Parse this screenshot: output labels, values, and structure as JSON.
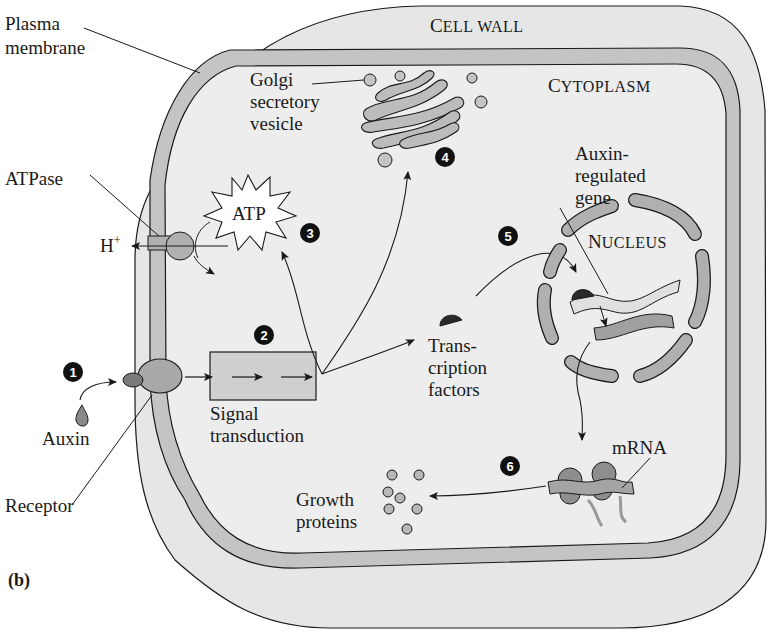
{
  "figure": {
    "panel_label": "(b)",
    "colors": {
      "cell_wall": "#e6e6e6",
      "cytoplasm": "#ececec",
      "membrane": "#c2c2c2",
      "organelle": "#b8b8b8",
      "outline": "#1a1a1a",
      "step_badge": "#111111"
    }
  },
  "regions": {
    "cell_wall": {
      "small_caps_first": "C",
      "rest": "ELL WALL"
    },
    "cytoplasm": {
      "small_caps_first": "C",
      "rest": "YTOPLASM"
    },
    "nucleus": {
      "small_caps_first": "N",
      "rest": "UCLEUS"
    }
  },
  "labels": {
    "plasma_membrane": [
      "Plasma",
      "membrane"
    ],
    "atpase": "ATPase",
    "h_plus": "H",
    "h_plus_sup": "+",
    "atp": "ATP",
    "golgi": [
      "Golgi",
      "secretory",
      "vesicle"
    ],
    "auxin_regulated_gene": [
      "Auxin-",
      "regulated",
      "gene"
    ],
    "transcription_factors": [
      "Trans-",
      "cription",
      "factors"
    ],
    "signal_transduction": [
      "Signal",
      "transduction"
    ],
    "auxin": "Auxin",
    "receptor": "Receptor",
    "mrna": "mRNA",
    "growth_proteins": [
      "Growth",
      "proteins"
    ]
  },
  "steps": [
    "1",
    "2",
    "3",
    "4",
    "5",
    "6"
  ]
}
